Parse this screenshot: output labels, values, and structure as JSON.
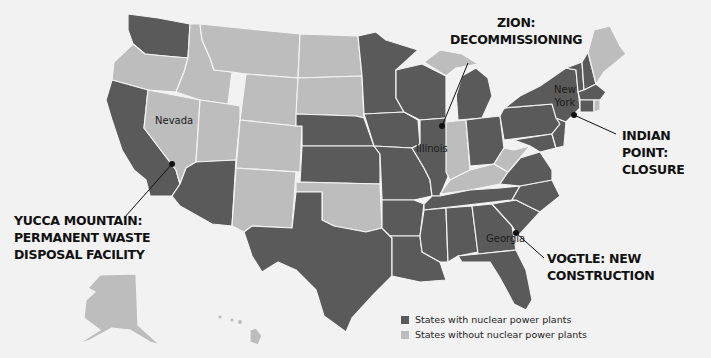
{
  "map": {
    "title": "Nuclear power plant states in the U.S.",
    "colors": {
      "with_nuclear": "#5a5a5a",
      "without_nuclear": "#bdbdbd",
      "background": "#f2f2f2",
      "border": "#f4f4f4"
    },
    "state_labels": [
      {
        "name": "Nevada"
      },
      {
        "name": "Illinois"
      },
      {
        "name": "New York"
      },
      {
        "name": "Georgia"
      }
    ],
    "callouts": {
      "zion": {
        "line1": "ZION:",
        "line2": "DECOMMISSIONING"
      },
      "yucca": {
        "line1": "YUCCA MOUNTAIN:",
        "line2": "PERMANENT WASTE",
        "line3": "DISPOSAL FACILITY"
      },
      "indian_point": {
        "line1": "INDIAN POINT:",
        "line2": "CLOSURE"
      },
      "vogtle": {
        "line1": "VOGTLE: NEW",
        "line2": "CONSTRUCTION"
      }
    },
    "legend": {
      "items": [
        {
          "label": "States with nuclear power plants",
          "color": "#5a5a5a"
        },
        {
          "label": "States without nuclear power plants",
          "color": "#bdbdbd"
        }
      ]
    }
  }
}
